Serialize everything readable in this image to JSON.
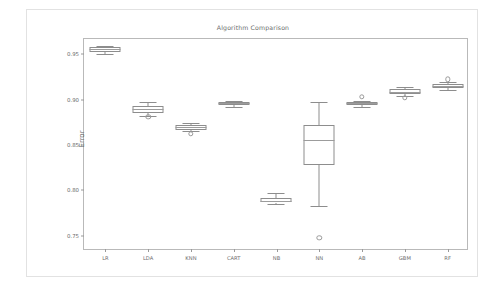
{
  "figure": {
    "ylabel": "Error"
  },
  "chart_data": {
    "type": "box",
    "title": "Algorithm Comparison",
    "xlabel": "",
    "ylabel": "Error",
    "ylim": [
      0.7335,
      0.9665
    ],
    "yticks": [
      0.75,
      0.8,
      0.85,
      0.9,
      0.95
    ],
    "ytick_labels": [
      "0.75",
      "0.80",
      "0.85",
      "0.90",
      "0.95"
    ],
    "grid": false,
    "legend": null,
    "categories": [
      "LR",
      "LDA",
      "KNN",
      "CART",
      "NB",
      "NN",
      "AB",
      "GBM",
      "RF"
    ],
    "boxes": [
      {
        "name": "LR",
        "whisker_low": 0.95,
        "q1": 0.9522,
        "median": 0.9552,
        "q3": 0.9572,
        "whisker_high": 0.9585,
        "outliers": []
      },
      {
        "name": "LDA",
        "whisker_low": 0.8822,
        "q1": 0.8855,
        "median": 0.8893,
        "q3": 0.893,
        "whisker_high": 0.8972,
        "outliers": [
          0.8808
        ]
      },
      {
        "name": "KNN",
        "whisker_low": 0.865,
        "q1": 0.8663,
        "median": 0.8693,
        "q3": 0.8722,
        "whisker_high": 0.874,
        "outliers": [
          0.862
        ]
      },
      {
        "name": "CART",
        "whisker_low": 0.8915,
        "q1": 0.8938,
        "median": 0.8962,
        "q3": 0.8972,
        "whisker_high": 0.8985,
        "outliers": []
      },
      {
        "name": "NB",
        "whisker_low": 0.7855,
        "q1": 0.7868,
        "median": 0.789,
        "q3": 0.792,
        "whisker_high": 0.7972,
        "outliers": []
      },
      {
        "name": "NN",
        "whisker_low": 0.7832,
        "q1": 0.8282,
        "median": 0.8552,
        "q3": 0.8718,
        "whisker_high": 0.8972,
        "outliers": [
          0.7482
        ]
      },
      {
        "name": "AB",
        "whisker_low": 0.8918,
        "q1": 0.8938,
        "median": 0.8962,
        "q3": 0.8972,
        "whisker_high": 0.8985,
        "outliers": [
          0.9032
        ]
      },
      {
        "name": "GBM",
        "whisker_low": 0.904,
        "q1": 0.9062,
        "median": 0.9085,
        "q3": 0.911,
        "whisker_high": 0.9142,
        "outliers": [
          0.9022
        ]
      },
      {
        "name": "RF",
        "whisker_low": 0.9102,
        "q1": 0.9122,
        "median": 0.9148,
        "q3": 0.9172,
        "whisker_high": 0.9188,
        "outliers": [
          0.9222
        ]
      }
    ]
  }
}
